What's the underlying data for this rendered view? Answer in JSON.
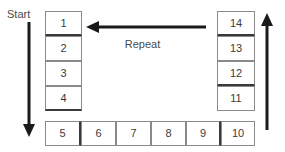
{
  "diagram": {
    "title_labels": {
      "start": "Start",
      "repeat": "Repeat"
    },
    "colors": {
      "cell_border": "#8a8a8a",
      "cell_border_strong": "#3a3a3a",
      "arrow": "#1a1a1a",
      "text": "#3b3b3b",
      "background": "#ffffff"
    },
    "left_column": {
      "cells": [
        {
          "label": "1"
        },
        {
          "label": "2"
        },
        {
          "label": "3"
        },
        {
          "label": "4"
        }
      ]
    },
    "bottom_row": {
      "cells": [
        {
          "label": "5"
        },
        {
          "label": "6"
        },
        {
          "label": "7"
        },
        {
          "label": "8"
        },
        {
          "label": "9"
        },
        {
          "label": "10"
        }
      ]
    },
    "right_column": {
      "cells": [
        {
          "label": "14"
        },
        {
          "label": "13"
        },
        {
          "label": "12"
        },
        {
          "label": "11"
        }
      ]
    },
    "arrows": {
      "start_down": {
        "direction": "down"
      },
      "repeat_left": {
        "direction": "left"
      },
      "return_up": {
        "direction": "up"
      }
    }
  }
}
